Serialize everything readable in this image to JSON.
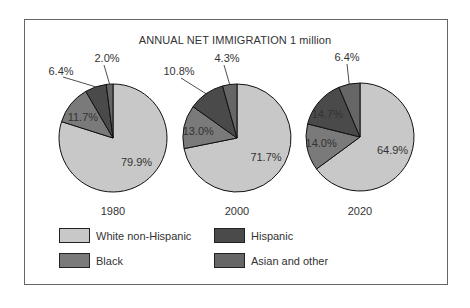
{
  "chart_data": {
    "type": "pie",
    "title": "ANNUAL NET IMMIGRATION 1 million",
    "categories": [
      "White non-Hispanic",
      "Black",
      "Hispanic",
      "Asian and other"
    ],
    "colors": {
      "White non-Hispanic": "#c8c8c8",
      "Black": "#7a7a7a",
      "Hispanic": "#4a4a4a",
      "Asian and other": "#666666"
    },
    "pies": [
      {
        "label": "1980",
        "values": [
          79.9,
          11.7,
          6.4,
          2.0
        ],
        "value_labels": [
          "79.9%",
          "11.7%",
          "6.4%",
          "2.0%"
        ]
      },
      {
        "label": "2000",
        "values": [
          71.7,
          13.0,
          10.8,
          4.3
        ],
        "value_labels": [
          "71.7%",
          "13.0%",
          "10.8%",
          "4.3%"
        ]
      },
      {
        "label": "2020",
        "values": [
          64.9,
          14.0,
          14.7,
          6.4
        ],
        "value_labels": [
          "64.9%",
          "14.0%",
          "14.7%",
          "6.4%"
        ]
      }
    ],
    "legend_position": "bottom"
  },
  "legend": [
    {
      "label": "White non-Hispanic",
      "color": "#c8c8c8"
    },
    {
      "label": "Hispanic",
      "color": "#4a4a4a"
    },
    {
      "label": "Black",
      "color": "#7a7a7a"
    },
    {
      "label": "Asian and other",
      "color": "#666666"
    }
  ]
}
